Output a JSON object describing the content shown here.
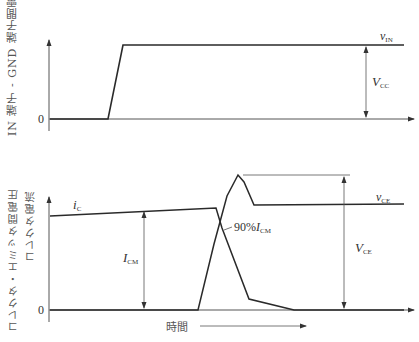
{
  "top_panel": {
    "ylabel": "IN 端子 - GND 端子間電圧",
    "zero_label": "0",
    "signal_label": "v",
    "signal_sub": "IN",
    "amplitude_label": "V",
    "amplitude_sub": "CC"
  },
  "bottom_panel": {
    "ylabel_line1": "コレクタ・エミッタ間電圧",
    "ylabel_line2": "コレクタ電流",
    "zero_label": "0",
    "current_label": "i",
    "current_sub": "C",
    "voltage_label": "v",
    "voltage_sub": "CE",
    "icm_label": "I",
    "icm_sub": "CM",
    "vce_label": "V",
    "vce_sub": "CE",
    "ninety_label_prefix": "90%",
    "ninety_label": "I",
    "ninety_sub": "CM",
    "xlabel": "時間"
  },
  "colors": {
    "trace": "#2a2a2a",
    "axis": "#444444",
    "text": "#333333"
  }
}
